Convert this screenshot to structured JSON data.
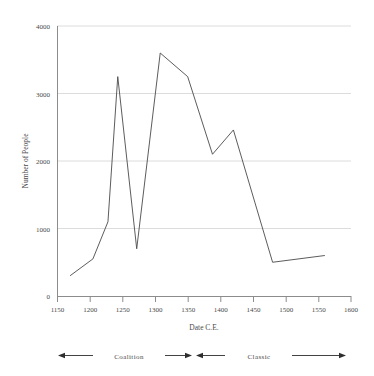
{
  "chart_data": {
    "type": "line",
    "title": "",
    "xlabel": "Date C.E.",
    "ylabel": "Number of People",
    "xlim": [
      1150,
      1600
    ],
    "ylim": [
      0,
      4000
    ],
    "xticks": [
      1150,
      1200,
      1250,
      1300,
      1350,
      1400,
      1450,
      1500,
      1550,
      1600
    ],
    "yticks": [
      0,
      1000,
      2000,
      3000,
      4000
    ],
    "grid": "horizontal",
    "legend": "none",
    "line_color": "#4a4a4a",
    "grid_color": "#dcdcdc",
    "axis_color": "#8c8c8c",
    "series": [
      {
        "name": "Number of People",
        "x": [
          1170,
          1205,
          1228,
          1243,
          1272,
          1308,
          1350,
          1388,
          1420,
          1480,
          1560
        ],
        "values": [
          300,
          550,
          1100,
          3250,
          700,
          3600,
          3250,
          2100,
          2460,
          500,
          600
        ]
      }
    ],
    "annotations": [
      {
        "label": "Coalition",
        "start": 1170,
        "end": 1290,
        "style": "double-arrow"
      },
      {
        "label": "Classic",
        "start": 1295,
        "end": 1555,
        "style": "double-arrow"
      }
    ]
  },
  "axes": {
    "x_tick_labels": [
      "1150",
      "1200",
      "1250",
      "1300",
      "1350",
      "1400",
      "1450",
      "1500",
      "1550",
      "1600"
    ],
    "y_tick_labels": [
      "0",
      "1000",
      "2000",
      "3000",
      "4000"
    ],
    "x_axis_title": "Date C.E.",
    "y_axis_title": "Number of People"
  },
  "periods": {
    "coalition_label": "Coalition",
    "classic_label": "Classic"
  }
}
